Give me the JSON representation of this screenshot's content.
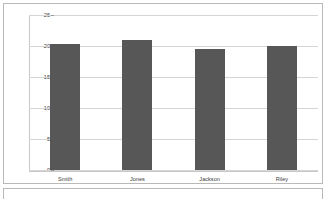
{
  "chart_data": {
    "type": "bar",
    "title": "",
    "xlabel": "",
    "ylabel": "",
    "categories": [
      "Smith",
      "Jones",
      "Jackson",
      "Riley"
    ],
    "values": [
      20.4,
      20.9,
      19.5,
      20.0
    ],
    "ylim": [
      0,
      25
    ],
    "yticks": [
      0,
      5,
      10,
      15,
      20,
      25
    ],
    "ytick_labels": [
      "0",
      "5",
      "10",
      "15",
      "20",
      "25"
    ],
    "grid": true,
    "legend": false,
    "bar_color": "#575757",
    "gridline_color": "#d5d5d5",
    "axis_color": "#c9c9c9",
    "background_color": "#ffffff",
    "panel_border_color": "#b9b9b9"
  },
  "chart_panel": {
    "name": "bar-chart-panel"
  },
  "bottom_panel": {
    "name": "secondary-panel"
  }
}
